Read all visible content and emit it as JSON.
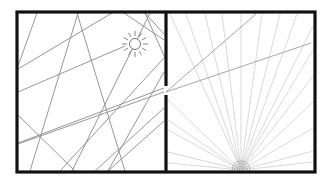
{
  "diagram": {
    "title": "",
    "colors": {
      "wall": "#111111",
      "ray_dark": "#8a8a8a",
      "ray_light": "#d9d9d9",
      "sun": "#777777",
      "background": "#ffffff"
    },
    "box": {
      "x1": 17,
      "y1": 12,
      "x2": 315,
      "y2": 172,
      "stroke_width": 3.2
    },
    "divider": {
      "x": 166,
      "gap_top": 86,
      "gap_bottom": 95
    },
    "sun": {
      "cx": 135,
      "cy": 44,
      "r": 5.5,
      "ray_inner": 8,
      "ray_outer": 13,
      "ray_count": 12
    },
    "left_rays": [
      [
        37,
        13,
        18,
        66
      ],
      [
        78,
        13,
        30,
        171
      ],
      [
        77,
        13,
        125,
        171
      ],
      [
        112,
        13,
        18,
        69
      ],
      [
        145,
        13,
        164,
        34
      ],
      [
        145,
        13,
        166,
        60
      ],
      [
        150,
        13,
        72,
        171
      ],
      [
        125,
        46,
        18,
        92
      ],
      [
        164,
        58,
        60,
        171
      ],
      [
        164,
        72,
        108,
        171
      ],
      [
        164,
        121,
        108,
        171
      ],
      [
        164,
        92,
        18,
        144
      ],
      [
        164,
        88,
        18,
        143
      ],
      [
        18,
        115,
        75,
        171
      ],
      [
        124,
        13,
        164,
        40
      ],
      [
        95,
        171,
        164,
        108
      ]
    ],
    "right_dark_rays": [
      [
        166,
        92,
        256,
        14
      ],
      [
        166,
        92,
        311,
        43
      ]
    ],
    "fan": {
      "cx": 241,
      "cy": 170,
      "targets": [
        [
          170,
          14
        ],
        [
          186,
          14
        ],
        [
          205,
          14
        ],
        [
          222,
          14
        ],
        [
          241,
          14
        ],
        [
          262,
          14
        ],
        [
          280,
          14
        ],
        [
          297,
          14
        ],
        [
          313,
          26
        ],
        [
          313,
          50
        ],
        [
          313,
          76
        ],
        [
          313,
          102
        ],
        [
          313,
          128
        ],
        [
          313,
          151
        ],
        [
          313,
          162
        ],
        [
          168,
          100
        ],
        [
          168,
          130
        ],
        [
          168,
          152
        ],
        [
          168,
          163
        ],
        [
          168,
          120
        ]
      ]
    },
    "semicircle": {
      "cx": 241,
      "cy": 170,
      "radii": [
        9,
        6.5,
        4,
        2
      ]
    }
  }
}
